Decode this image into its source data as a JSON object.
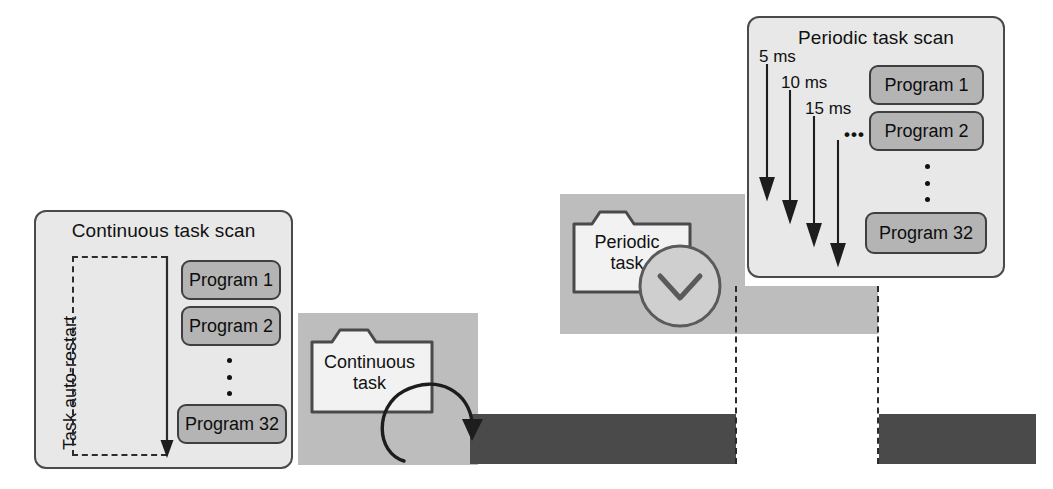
{
  "diagram": {
    "colors": {
      "panel_fill": "#e8e8e8",
      "panel_stroke": "#4a4a4a",
      "program_fill": "#b4b4b4",
      "program_stroke": "#3f3f3f",
      "block_gray": "#bdbdbd",
      "block_dark": "#4a4a4a",
      "line": "#2b2b2b",
      "text": "#111111",
      "folder_fill": "#f2f2f2"
    }
  },
  "continuous_panel": {
    "title": "Continuous task scan",
    "restart_label": "Task auto-restart",
    "programs": [
      "Program 1",
      "Program 2",
      "Program 32"
    ],
    "ellipsis": "⋮"
  },
  "periodic_panel": {
    "title": "Periodic task scan",
    "interval_labels": [
      "5 ms",
      "10 ms",
      "15 ms"
    ],
    "interval_more": "•••",
    "programs": [
      "Program 1",
      "Program 2",
      "Program 32"
    ],
    "ellipsis": "⋮"
  },
  "continuous_task_icon": {
    "line1": "Continuous",
    "line2": "task",
    "icon": "folder-with-loop-arrow"
  },
  "periodic_task_icon": {
    "line1": "Periodic",
    "line2": "task",
    "icon": "folder-with-clock"
  },
  "timeline": {
    "gray_blocks": 2,
    "dark_bars": 2,
    "dashed_guides": 2
  }
}
